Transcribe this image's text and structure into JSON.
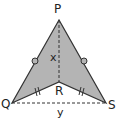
{
  "diagram": {
    "type": "geometry",
    "fill_color": "#b4b4b4",
    "stroke_color": "#333333",
    "points": {
      "P": {
        "label": "P",
        "x": 59,
        "y": 20
      },
      "Q": {
        "label": "Q",
        "x": 12,
        "y": 103
      },
      "R": {
        "label": "R",
        "x": 59,
        "y": 82
      },
      "S": {
        "label": "S",
        "x": 106,
        "y": 103
      }
    },
    "labels": {
      "P": "P",
      "Q": "Q",
      "R": "R",
      "S": "S",
      "x": "x",
      "y": "y"
    },
    "segments": [
      {
        "from": "P",
        "to": "Q",
        "style": "solid",
        "mark": "circle"
      },
      {
        "from": "P",
        "to": "S",
        "style": "solid",
        "mark": "circle"
      },
      {
        "from": "Q",
        "to": "R",
        "style": "solid",
        "mark": "double-tick"
      },
      {
        "from": "R",
        "to": "S",
        "style": "solid",
        "mark": "double-tick"
      },
      {
        "from": "P",
        "to": "R",
        "style": "dashed",
        "length_label": "x"
      },
      {
        "from": "Q",
        "to": "S",
        "style": "dashed",
        "length_label": "y"
      }
    ]
  }
}
